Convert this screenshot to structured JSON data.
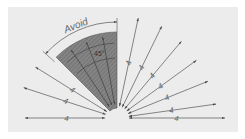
{
  "diagram": {
    "avoid_label": "Avoid",
    "avoid_angle_label": "45°",
    "dimension_value": "4",
    "colors": {
      "panel": "#ececec",
      "line": "#555555",
      "hatch_fill": "#7a7a7a",
      "hatch_stroke": "#9a9a9a",
      "text": "#666666"
    },
    "center": {
      "x": 117,
      "y": 118
    },
    "avoid_zone": {
      "start_deg": 90,
      "end_deg": 135,
      "inner_r": 10,
      "outer_r": 86,
      "label_arc_r": 96
    },
    "rays": [
      {
        "deg": 0,
        "len": 108,
        "label": "4"
      },
      {
        "deg": 8,
        "len": 100,
        "label": "4"
      },
      {
        "deg": 22,
        "len": 98,
        "label": "4"
      },
      {
        "deg": 36,
        "len": 98,
        "label": "4"
      },
      {
        "deg": 50,
        "len": 100,
        "label": "4"
      },
      {
        "deg": 64,
        "len": 102,
        "label": "4"
      },
      {
        "deg": 78,
        "len": 102,
        "label": "4"
      },
      {
        "deg": 148,
        "len": 96,
        "label": "4"
      },
      {
        "deg": 162,
        "len": 98,
        "label": "4"
      },
      {
        "deg": 180,
        "len": 92,
        "label": "4"
      }
    ]
  }
}
